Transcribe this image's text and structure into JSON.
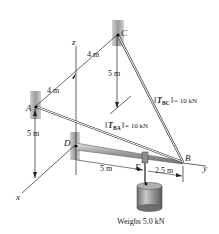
{
  "diagram": {
    "points": {
      "A": "A",
      "B": "B",
      "C": "C",
      "D": "D",
      "E": "E"
    },
    "axes": {
      "x": "x",
      "y": "y",
      "z": "z"
    },
    "dimensions": {
      "dim_DA_upper": "4 m",
      "dim_AC_left": "4 m",
      "dim_C_down": "5 m",
      "dim_A_down": "5 m",
      "dim_DE": "5 m",
      "dim_EB": "2.5 m"
    },
    "forces": {
      "T_BC_sym": "T",
      "T_BC_sub": "BC",
      "T_BC_val": "= 10 kN",
      "T_BA_sym": "T",
      "T_BA_sub": "BA",
      "T_BA_val": "= 10 kN"
    },
    "weight_label": "Weighs 5.0 kN",
    "colors": {
      "wall": "#a8a8a8",
      "boom": "#b8b8b8",
      "cylinder": "#9a9a9a",
      "line": "#222222"
    }
  }
}
